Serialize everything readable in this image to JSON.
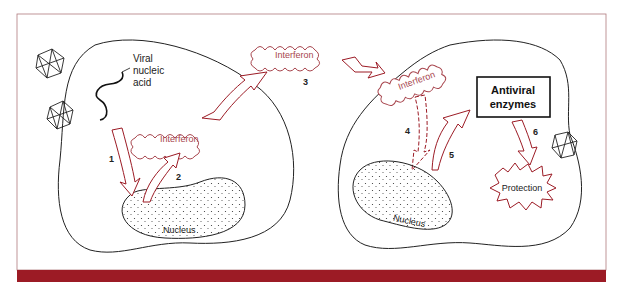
{
  "diagram": {
    "colors": {
      "accent": "#9c1b25",
      "line": "#222222",
      "background": "#ffffff",
      "cloud_text": "#a8464e"
    },
    "left_cell": {
      "viral_label_line1": "Viral",
      "viral_label_line2": "nucleic",
      "viral_label_line3": "acid",
      "interferon_label": "Interferon",
      "nucleus_label": "Nucleus"
    },
    "extracellular": {
      "interferon_label": "Interferon"
    },
    "right_cell": {
      "interferon_label": "Interferon",
      "enzymes_line1": "Antiviral",
      "enzymes_line2": "enzymes",
      "protection_label": "Protection",
      "nucleus_label": "Nucleus"
    },
    "steps": [
      "1",
      "2",
      "3",
      "4",
      "5",
      "6"
    ]
  }
}
